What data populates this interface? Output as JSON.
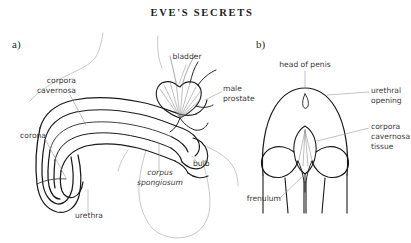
{
  "figure": {
    "title": "EVE'S SECRETS",
    "background_color": "#ffffff",
    "ink_color": "#1a1a1a",
    "light_ink_color": "#9a9a9a",
    "label_color": "#3a3a3a",
    "leader_color": "#8c8c8c"
  },
  "panels": [
    {
      "id": "a",
      "letter": "a)",
      "caption": "sagittal view"
    },
    {
      "id": "b",
      "letter": "b)",
      "caption": "frontal view of head"
    }
  ],
  "labels_a": [
    {
      "name": "corpora-cavernosa",
      "line1": "corpora",
      "line2": "cavernosa",
      "italic": false
    },
    {
      "name": "corona",
      "line1": "corona",
      "line2": "",
      "italic": false
    },
    {
      "name": "urethra",
      "line1": "urethra",
      "line2": "",
      "italic": false
    },
    {
      "name": "bladder",
      "line1": "bladder",
      "line2": "",
      "italic": false
    },
    {
      "name": "male-prostate",
      "line1": "male",
      "line2": "prostate",
      "italic": false
    },
    {
      "name": "bulb",
      "line1": "bulb",
      "line2": "",
      "italic": false
    },
    {
      "name": "corpus-spongiosum",
      "line1": "corpus",
      "line2": "spongiosum",
      "italic": true
    }
  ],
  "labels_b": [
    {
      "name": "head-of-penis",
      "line1": "head of penis",
      "line2": "",
      "line3": "",
      "italic": false
    },
    {
      "name": "urethral-opening",
      "line1": "urethral",
      "line2": "opening",
      "line3": "",
      "italic": false
    },
    {
      "name": "corpora-cavernosa-tissue",
      "line1": "corpora",
      "line2": "cavernosa",
      "line3": "tissue",
      "italic": true
    },
    {
      "name": "frenulum",
      "line1": "frenulum",
      "line2": "",
      "line3": "",
      "italic": false
    }
  ]
}
